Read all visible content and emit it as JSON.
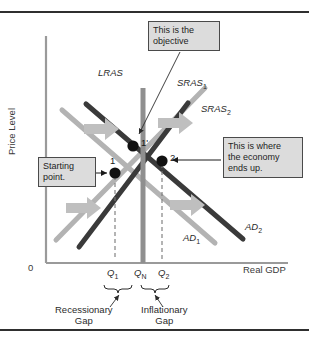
{
  "figure": {
    "axes": {
      "y_label": "Price Level",
      "x_label": "Real GDP",
      "origin_label": "0"
    },
    "curves": [
      {
        "name": "lras",
        "label": "LRAS",
        "label_html": "LRAS",
        "color": "#8f8f8f",
        "style": "vertical"
      },
      {
        "name": "sras1",
        "label": "SRAS1",
        "base": "SRAS",
        "sub": "1",
        "color": "#b3b3b3",
        "style": "upward"
      },
      {
        "name": "sras2",
        "label": "SRAS2",
        "base": "SRAS",
        "sub": "2",
        "color": "#3a3a3a",
        "style": "upward"
      },
      {
        "name": "ad1",
        "label": "AD1",
        "base": "AD",
        "sub": "1",
        "color": "#b3b3b3",
        "style": "downward"
      },
      {
        "name": "ad2",
        "label": "AD2",
        "base": "AD",
        "sub": "2",
        "color": "#3a3a3a",
        "style": "downward"
      }
    ],
    "points": [
      {
        "name": "point-1",
        "label": "1",
        "x_tick": "Q1"
      },
      {
        "name": "point-1prime",
        "label": "1'",
        "x_tick": "QN"
      },
      {
        "name": "point-2",
        "label": "2",
        "x_tick": "Q2"
      }
    ],
    "x_ticks": [
      {
        "name": "q1",
        "base": "Q",
        "sub": "1"
      },
      {
        "name": "qn",
        "base": "Q",
        "sub": "N"
      },
      {
        "name": "q2",
        "base": "Q",
        "sub": "2"
      }
    ],
    "callouts": [
      {
        "name": "objective",
        "line1": "This is the",
        "line2": "objective",
        "line3": ""
      },
      {
        "name": "starting",
        "line1": "Starting",
        "line2": "point.",
        "line3": ""
      },
      {
        "name": "ends-up",
        "line1": "This is where",
        "line2": "the economy",
        "line3": "ends up."
      }
    ],
    "gaps": [
      {
        "name": "recessionary-gap",
        "line1": "Recessionary",
        "line2": "Gap"
      },
      {
        "name": "inflationary-gap",
        "line1": "Inflationary",
        "line2": "Gap"
      }
    ],
    "colors": {
      "light_curve": "#b3b3b3",
      "dark_curve": "#3a3a3a",
      "lras": "#8f8f8f",
      "block_arrow": "#bfbfbf",
      "axis": "#9a9a9a",
      "callout_bg": "#dcdcdc",
      "rule": "#2f2f2f"
    }
  }
}
